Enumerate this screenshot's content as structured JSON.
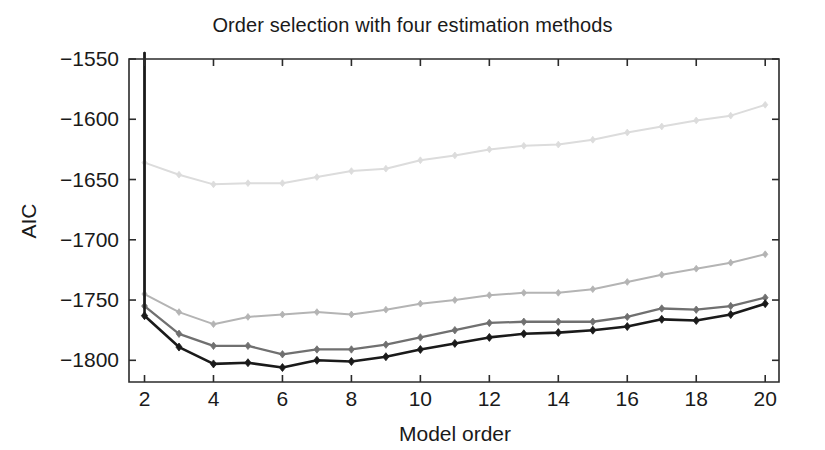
{
  "chart_data": {
    "type": "line",
    "title": "Order selection with four estimation methods",
    "xlabel": "Model order",
    "ylabel": "AIC",
    "xlim": [
      1.55,
      20.4
    ],
    "ylim": [
      -1818,
      -1550
    ],
    "grid": false,
    "legend": "none",
    "x": [
      2,
      3,
      4,
      5,
      6,
      7,
      8,
      9,
      10,
      11,
      12,
      13,
      14,
      15,
      16,
      17,
      18,
      19,
      20
    ],
    "xticks": [
      2,
      4,
      6,
      8,
      10,
      12,
      14,
      16,
      18,
      20
    ],
    "xticklabels": [
      "2",
      "4",
      "6",
      "8",
      "10",
      "12",
      "14",
      "16",
      "18",
      "20"
    ],
    "yticks": [
      -1550,
      -1600,
      -1650,
      -1700,
      -1750,
      -1800
    ],
    "yticklabels": [
      "-1550",
      "-1600",
      "-1650",
      "-1700",
      "-1750",
      "-1800"
    ],
    "marker": "diamond",
    "series": [
      {
        "name": "method-1-lightest",
        "color": "#dcdcdc",
        "values": [
          -1636,
          -1646,
          -1654,
          -1653,
          -1653,
          -1648,
          -1643,
          -1641,
          -1634,
          -1630,
          -1625,
          -1622,
          -1621,
          -1617,
          -1611,
          -1606,
          -1601,
          -1597,
          -1588
        ]
      },
      {
        "name": "method-2-light",
        "color": "#b4b4b4",
        "values": [
          -1745,
          -1760,
          -1770,
          -1764,
          -1762,
          -1760,
          -1762,
          -1758,
          -1753,
          -1750,
          -1746,
          -1744,
          -1744,
          -1741,
          -1735,
          -1729,
          -1724,
          -1719,
          -1712
        ]
      },
      {
        "name": "method-3-mid",
        "color": "#707070",
        "values": [
          -1755,
          -1778,
          -1788,
          -1788,
          -1795,
          -1791,
          -1791,
          -1787,
          -1781,
          -1775,
          -1769,
          -1768,
          -1768,
          -1768,
          -1764,
          -1757,
          -1758,
          -1755,
          -1748
        ]
      },
      {
        "name": "method-4-dark",
        "color": "#1a1a1a",
        "values": [
          -1763,
          -1789,
          -1803,
          -1802,
          -1806,
          -1800,
          -1801,
          -1797,
          -1791,
          -1786,
          -1781,
          -1778,
          -1777,
          -1775,
          -1772,
          -1766,
          -1767,
          -1762,
          -1753
        ]
      }
    ],
    "offscreen_note": "all four series descend steeply from above the top axis limit into x=2"
  },
  "figure": {
    "background_color": "#ffffff",
    "axis_color": "#2b2b2b"
  }
}
